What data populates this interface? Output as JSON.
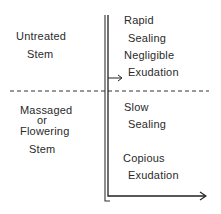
{
  "diagram": {
    "left_labels": {
      "top": {
        "line1": "Untreated",
        "line2": "Stem"
      },
      "bottom": {
        "line1": "Massaged",
        "line2": "or",
        "line3": "Flowering",
        "line4": "Stem"
      }
    },
    "right_labels": {
      "top": {
        "rate": "Rapid",
        "rate_noun": "Sealing",
        "amount": "Negligible",
        "amount_noun": "Exudation"
      },
      "bottom": {
        "rate": "Slow",
        "rate_noun": "Sealing",
        "amount": "Copious",
        "amount_noun": "Exudation"
      }
    },
    "colors": {
      "ink": "#2a2a2a",
      "background": "#ffffff"
    }
  }
}
